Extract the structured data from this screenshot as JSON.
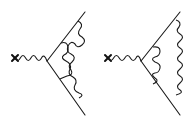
{
  "figure": {
    "colors": {
      "ink": "#1a1a1a",
      "background": "#ffffff"
    },
    "diagrams": [
      {
        "id": "left",
        "topology": "crossed photon ladder",
        "external_insertion": "cross",
        "internal_photons": 2,
        "photons_cross": true
      },
      {
        "id": "right",
        "topology": "nested photon ladder",
        "external_insertion": "cross",
        "internal_photons": 2,
        "photons_cross": false
      }
    ]
  }
}
